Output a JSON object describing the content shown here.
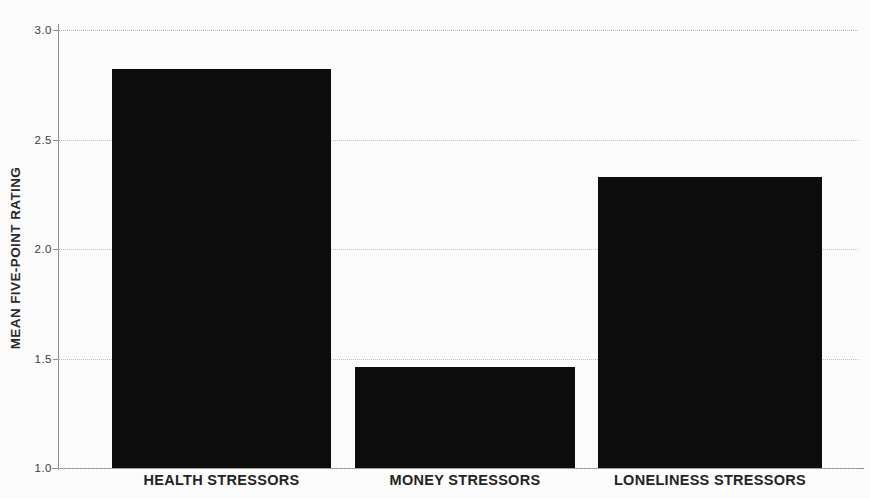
{
  "chart_data": {
    "type": "bar",
    "title": "",
    "subtitle": "",
    "xlabel": "",
    "ylabel": "MEAN FIVE-POINT RATING",
    "categories": [
      "HEALTH STRESSORS",
      "MONEY STRESSORS",
      "LONELINESS STRESSORS"
    ],
    "values": [
      2.82,
      1.46,
      2.33
    ],
    "ylim": [
      1.0,
      3.0
    ],
    "yticks": [
      1.0,
      1.5,
      2.0,
      2.5,
      3.0
    ],
    "ytick_labels": [
      "1.0",
      "1.5",
      "2.0",
      "2.5",
      "3.0"
    ],
    "grid": true,
    "grid_axis": "y",
    "legend": false,
    "legend_position": "none",
    "bar_color": "#0c0c0c",
    "background_color": "#ffffff",
    "axis_color": "#8d8d8d",
    "gridline_color": "#b9b9b9",
    "series": [
      {
        "name": "Mean five-point rating",
        "values": [
          2.82,
          1.46,
          2.33
        ]
      }
    ]
  }
}
